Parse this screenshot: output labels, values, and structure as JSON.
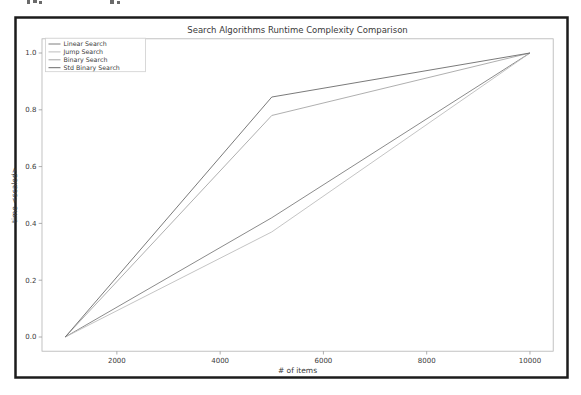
{
  "page": {
    "kind": "scanned figure of a matplotlib line chart inside a black frame"
  },
  "chart_data": {
    "type": "line",
    "title": "Search Algorithms Runtime Complexity Comparison",
    "xlabel": "# of items",
    "ylabel": "time <scaled>",
    "x": [
      1000,
      5000,
      10000
    ],
    "series": [
      {
        "name": "Linear Search",
        "values": [
          0.0,
          0.42,
          1.0
        ],
        "color": "#7e7e7e"
      },
      {
        "name": "Jump Search",
        "values": [
          0.0,
          0.37,
          1.0
        ],
        "color": "#bdbdbd"
      },
      {
        "name": "Binary Search",
        "values": [
          0.0,
          0.78,
          1.0
        ],
        "color": "#a6a6a6"
      },
      {
        "name": "Std Binary Search",
        "values": [
          0.0,
          0.845,
          1.0
        ],
        "color": "#6b6b6b"
      }
    ],
    "xticks": [
      2000,
      4000,
      6000,
      8000,
      10000
    ],
    "yticks": [
      "0.0",
      "0.2",
      "0.4",
      "0.6",
      "0.8",
      "1.0"
    ],
    "xlim": [
      550,
      10450
    ],
    "ylim": [
      -0.05,
      1.05
    ],
    "grid": false,
    "legend": {
      "position": "upper left"
    }
  },
  "colors": {
    "frame": "#1c1c1c",
    "axes_spine": "#b3b3b3",
    "tick": "#9a9a9a",
    "text": "#3a3a3a",
    "legend_border": "#cfcfcf"
  }
}
